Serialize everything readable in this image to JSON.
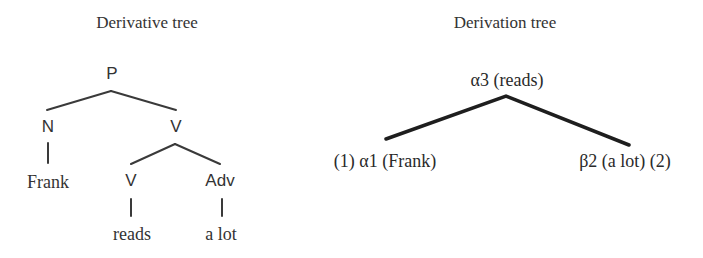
{
  "derivative_tree": {
    "title": "Derivative tree",
    "nodes": {
      "root": "P",
      "n": "N",
      "v_phrase": "V",
      "frank": "Frank",
      "v": "V",
      "adv": "Adv",
      "reads": "reads",
      "a_lot": "a lot"
    }
  },
  "derivation_tree": {
    "title": "Derivation tree",
    "nodes": {
      "root": "α3 (reads)",
      "left": "(1) α1 (Frank)",
      "right": "β2 (a lot) (2)"
    }
  },
  "colors": {
    "text": "#333333",
    "thin_edge": "#3a3a3a",
    "thick_edge": "#1e1e1e"
  }
}
